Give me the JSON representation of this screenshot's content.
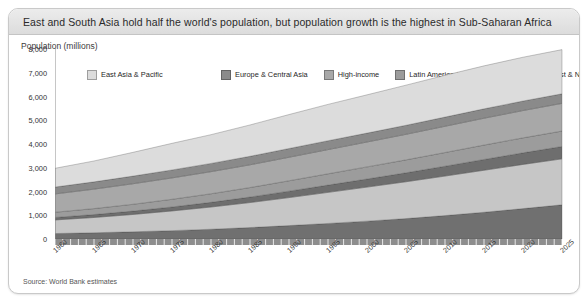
{
  "header": {
    "title": "East and South Asia hold half the world's population, but population growth is the highest in Sub-Saharan Africa"
  },
  "axis_title": "Population (millions)",
  "source": "Source: World Bank estimates",
  "legend": {
    "items": [
      {
        "label": "East Asia & Pacific",
        "color": "#dcdcdc"
      },
      {
        "label": "Europe & Central Asia",
        "color": "#8a8a8a"
      },
      {
        "label": "High-income",
        "color": "#a8a8a8"
      },
      {
        "label": "Latin America & Caribbean",
        "color": "#9c9c9c"
      },
      {
        "label": "Middle East & North Africa",
        "color": "#6e6e6e"
      },
      {
        "label": "South Asia",
        "color": "#c6c6c6"
      },
      {
        "label": "Sub-Saharan Africa",
        "color": "#707070"
      }
    ]
  },
  "chart_data": {
    "type": "area",
    "title": "East and South Asia hold half the world's population, but population growth is the highest in Sub-Saharan Africa",
    "xlabel": "",
    "ylabel": "Population (millions)",
    "ylim": [
      0,
      8000
    ],
    "yticks": [
      "0",
      "1,000",
      "2,000",
      "3,000",
      "4,000",
      "5,000",
      "6,000",
      "7,000",
      "8,000"
    ],
    "ytick_values": [
      0,
      1000,
      2000,
      3000,
      4000,
      5000,
      6000,
      7000,
      8000
    ],
    "xlim": [
      1960,
      2025
    ],
    "xticks": [
      "1960",
      "1965",
      "1970",
      "1975",
      "1980",
      "1985",
      "1990",
      "1995",
      "2000",
      "2005",
      "2010",
      "2015",
      "2020",
      "2025"
    ],
    "xtick_values": [
      1960,
      1965,
      1970,
      1975,
      1980,
      1985,
      1990,
      1995,
      2000,
      2005,
      2010,
      2015,
      2020,
      2025
    ],
    "minor_tick_step": 1,
    "grid": false,
    "stacked": true,
    "stack_order_bottom_to_top": [
      "Sub-Saharan Africa",
      "South Asia",
      "Middle East & North Africa",
      "Latin America & Caribbean",
      "High-income",
      "Europe & Central Asia",
      "East Asia & Pacific"
    ],
    "x": [
      1960,
      1965,
      1970,
      1975,
      1980,
      1985,
      1990,
      1995,
      2000,
      2005,
      2010,
      2015,
      2020,
      2025
    ],
    "series": [
      {
        "name": "Sub-Saharan Africa",
        "color": "#707070",
        "values": [
          230,
          263,
          303,
          352,
          411,
          482,
          564,
          655,
          752,
          860,
          986,
          1126,
          1280,
          1440
        ]
      },
      {
        "name": "South Asia",
        "color": "#c6c6c6",
        "values": [
          572,
          644,
          731,
          830,
          936,
          1053,
          1180,
          1309,
          1434,
          1551,
          1664,
          1769,
          1860,
          1935
        ]
      },
      {
        "name": "Middle East & North Africa",
        "color": "#6e6e6e",
        "values": [
          105,
          121,
          141,
          166,
          196,
          231,
          270,
          306,
          339,
          376,
          414,
          453,
          488,
          520
        ]
      },
      {
        "name": "Latin America & Caribbean",
        "color": "#9c9c9c",
        "values": [
          220,
          252,
          287,
          324,
          362,
          400,
          438,
          475,
          511,
          545,
          577,
          607,
          631,
          650
        ]
      },
      {
        "name": "High-income",
        "color": "#a8a8a8",
        "values": [
          770,
          820,
          865,
          900,
          930,
          958,
          990,
          1020,
          1048,
          1076,
          1105,
          1130,
          1150,
          1165
        ]
      },
      {
        "name": "Europe & Central Asia",
        "color": "#8a8a8a",
        "values": [
          290,
          306,
          322,
          336,
          348,
          358,
          368,
          373,
          376,
          380,
          387,
          395,
          400,
          404
        ]
      },
      {
        "name": "East Asia & Pacific",
        "color": "#dcdcdc",
        "values": [
          790,
          880,
          1000,
          1120,
          1210,
          1320,
          1430,
          1530,
          1610,
          1690,
          1760,
          1810,
          1845,
          1860
        ]
      }
    ],
    "totals": [
      2977,
      3286,
      3649,
      4028,
      4393,
      4802,
      5240,
      5668,
      6070,
      6478,
      6893,
      7290,
      7654,
      7974
    ]
  }
}
